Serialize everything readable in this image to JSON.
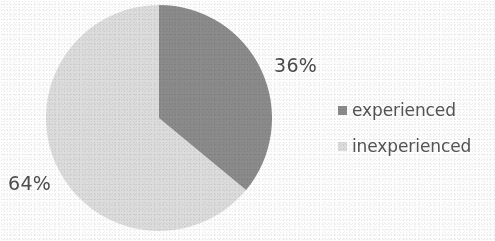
{
  "chart_data": {
    "type": "pie",
    "title": "",
    "subtitle": "",
    "xlabel": "",
    "ylabel": "",
    "categories": [
      "experienced",
      "inexperienced"
    ],
    "values": [
      36,
      64
    ],
    "value_unit": "%",
    "data_labels": [
      "36%",
      "64%"
    ],
    "colors": [
      "#8b8b8b",
      "#dcdcdc"
    ],
    "legend": {
      "position": "right",
      "entries": [
        {
          "label": "experienced",
          "color": "#8b8b8b",
          "value": 36,
          "data_label": "36%"
        },
        {
          "label": "inexperienced",
          "color": "#dcdcdc",
          "value": 64,
          "data_label": "64%"
        }
      ]
    },
    "start_angle_deg": 0,
    "direction": "clockwise",
    "grid": false,
    "slices": [
      {
        "name": "experienced",
        "data_label": "36%",
        "value": 36,
        "color": "#8b8b8b",
        "start_angle_deg": 0,
        "end_angle_deg": 129.6
      },
      {
        "name": "inexperienced",
        "data_label": "64%",
        "value": 64,
        "color": "#dcdcdc",
        "start_angle_deg": 129.6,
        "end_angle_deg": 360
      }
    ]
  },
  "figure": {
    "background_color": "#fdfdfd",
    "text_color": "#4d4d4d"
  }
}
